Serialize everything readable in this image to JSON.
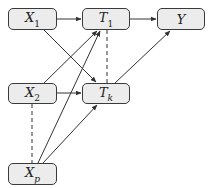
{
  "diagram": {
    "type": "directed-graph",
    "nodes": [
      {
        "id": "X1",
        "base": "X",
        "sub": "1",
        "sub_italic": false
      },
      {
        "id": "T1",
        "base": "T",
        "sub": "1",
        "sub_italic": false
      },
      {
        "id": "Y",
        "base": "Y",
        "sub": "",
        "sub_italic": false
      },
      {
        "id": "X2",
        "base": "X",
        "sub": "2",
        "sub_italic": false
      },
      {
        "id": "Tk",
        "base": "T",
        "sub": "k",
        "sub_italic": true
      },
      {
        "id": "Xp",
        "base": "X",
        "sub": "p",
        "sub_italic": true
      }
    ],
    "edges": [
      {
        "from": "X1",
        "to": "T1",
        "style": "solid-arrow"
      },
      {
        "from": "T1",
        "to": "Y",
        "style": "solid-arrow"
      },
      {
        "from": "X2",
        "to": "Tk",
        "style": "solid-arrow"
      },
      {
        "from": "X1",
        "to": "Tk",
        "style": "solid-arrow"
      },
      {
        "from": "X2",
        "to": "T1",
        "style": "solid-arrow"
      },
      {
        "from": "Xp",
        "to": "T1",
        "style": "solid-arrow"
      },
      {
        "from": "Xp",
        "to": "Tk",
        "style": "solid-arrow"
      },
      {
        "from": "Tk",
        "to": "Y",
        "style": "solid-arrow"
      },
      {
        "from": "T1",
        "to": "Tk",
        "style": "dashed"
      },
      {
        "from": "X2",
        "to": "Xp",
        "style": "dashed"
      }
    ],
    "colors": {
      "node_fill": "#ececec",
      "node_border": "#3a3a3a",
      "edge": "#333333"
    }
  }
}
